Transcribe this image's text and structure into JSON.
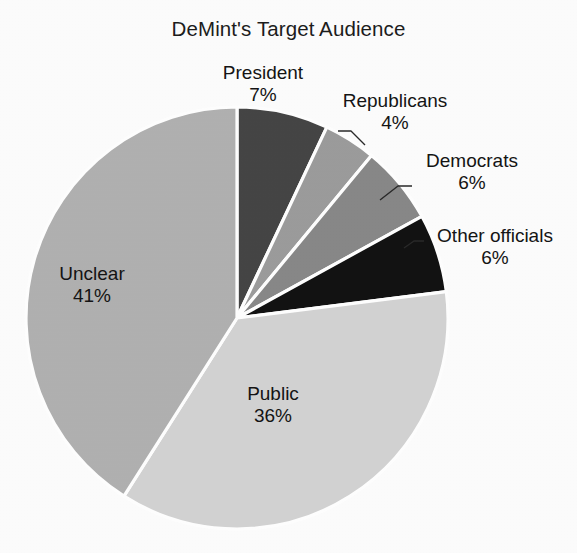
{
  "chart_data": {
    "type": "pie",
    "title": "DeMint's Target Audience",
    "xlabel": "",
    "ylabel": "",
    "legend": "none",
    "grid": false,
    "categories": [
      "President",
      "Republicans",
      "Democrats",
      "Other officials",
      "Public",
      "Unclear"
    ],
    "values": [
      7,
      4,
      6,
      6,
      36,
      41
    ],
    "value_unit": "%",
    "slices": [
      {
        "label": "President",
        "value": 7,
        "value_text": "7%",
        "color": "#454545",
        "start_angle_deg": 0,
        "end_angle_deg": 25.2
      },
      {
        "label": "Republicans",
        "value": 4,
        "value_text": "4%",
        "color": "#9c9c9c",
        "start_angle_deg": 25.2,
        "end_angle_deg": 39.6
      },
      {
        "label": "Democrats",
        "value": 6,
        "value_text": "6%",
        "color": "#888888",
        "start_angle_deg": 39.6,
        "end_angle_deg": 61.2
      },
      {
        "label": "Other officials",
        "value": 6,
        "value_text": "6%",
        "color": "#121212",
        "start_angle_deg": 61.2,
        "end_angle_deg": 82.8
      },
      {
        "label": "Public",
        "value": 36,
        "value_text": "36%",
        "color": "#d3d3d3",
        "start_angle_deg": 82.8,
        "end_angle_deg": 212.4
      },
      {
        "label": "Unclear",
        "value": 41,
        "value_text": "41%",
        "color": "#b1b1b1",
        "start_angle_deg": 212.4,
        "end_angle_deg": 360
      }
    ],
    "background_color": "#fdfdfd",
    "separator_color": "#ffffff",
    "center_x": 237,
    "center_y": 318,
    "radius": 211
  },
  "labels": {
    "president": {
      "name": "President",
      "pct": "7%"
    },
    "republicans": {
      "name": "Republicans",
      "pct": "4%"
    },
    "democrats": {
      "name": "Democrats",
      "pct": "6%"
    },
    "other_officials": {
      "name": "Other officials",
      "pct": "6%"
    },
    "public": {
      "name": "Public",
      "pct": "36%"
    },
    "unclear": {
      "name": "Unclear",
      "pct": "41%"
    }
  }
}
